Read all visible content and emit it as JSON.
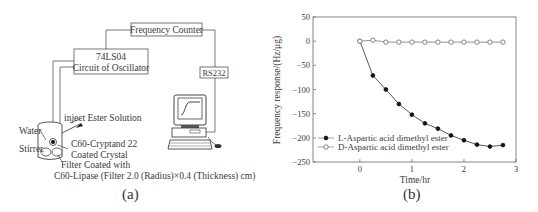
{
  "panel_a": {
    "caption": "(a)",
    "boxes": {
      "frequency_counter": "Frequency Counter",
      "oscillator_line1": "74LS04",
      "oscillator_line2": "Circuit of Oscillator",
      "rs232": "RS232"
    },
    "labels": {
      "inject": "inject Ester Solution",
      "water": "Water",
      "stirrer": "Stirrer",
      "crystal_line1": "C60-Cryptand 22",
      "crystal_line2": "Coated Crystal",
      "filter_line1": "Filter Coated with",
      "filter_line2": "C60-Lipase (Filter 2.0 (Radius)×0.4 (Thickness) cm)"
    },
    "icons": [
      "computer-icon",
      "quartz-cell-icon",
      "syringe-icon",
      "mouse-icon"
    ]
  },
  "panel_b": {
    "caption": "(b)"
  },
  "chart_data": {
    "type": "line",
    "title": "",
    "xlabel": "Time/hr",
    "ylabel": "Frequency response/(Hz/μg)",
    "xlim": [
      -0.9,
      3
    ],
    "ylim": [
      -250,
      50
    ],
    "xticks": [
      0,
      1,
      2,
      3
    ],
    "yticks": [
      50,
      0,
      -50,
      -100,
      -150,
      -200,
      -250
    ],
    "grid": false,
    "legend_position": "lower left",
    "x": [
      0,
      0.25,
      0.5,
      0.75,
      1.0,
      1.25,
      1.5,
      1.75,
      2.0,
      2.25,
      2.5,
      2.75
    ],
    "series": [
      {
        "name": "L-Aspartic acid dimethyl ester",
        "marker": "filled-circle",
        "color": "#222222",
        "values": [
          0,
          -71,
          -100,
          -130,
          -152,
          -170,
          -181,
          -195,
          -205,
          -214,
          -218,
          -215
        ]
      },
      {
        "name": "D-Aspartic acid dimethyl ester",
        "marker": "open-circle",
        "color": "#888888",
        "values": [
          0,
          2,
          -2,
          -2,
          -2,
          -2,
          -2,
          -2,
          -2,
          -2,
          -2,
          -2
        ]
      }
    ]
  }
}
